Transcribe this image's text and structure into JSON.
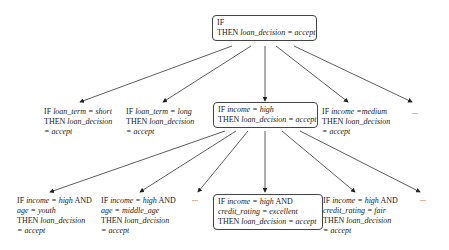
{
  "diagram": {
    "type": "rule-refinement-tree",
    "root": {
      "lines": [
        "IF",
        "THEN loan_decision = accept"
      ],
      "if": "IF",
      "then_kw": "THEN",
      "then_expr": "loan_decision = accept"
    },
    "level1": [
      {
        "if_kw": "IF",
        "if_expr": "loan_term = short",
        "then_kw": "THEN",
        "then_expr": "loan_decision",
        "cont": "= accept"
      },
      {
        "if_kw": "IF",
        "if_expr": "loan_term = long",
        "then_kw": "THEN",
        "then_expr": "loan_decision",
        "cont": "= accept"
      },
      {
        "if_kw": "IF",
        "if_expr": "income = high",
        "then_kw": "THEN",
        "then_expr": "loan_decision = accept",
        "boxed": true
      },
      {
        "if_kw": "IF",
        "if_expr": "income =medium",
        "then_kw": "THEN",
        "then_expr": "loan_decision",
        "cont": "= accept"
      },
      {
        "text": "..."
      }
    ],
    "level2": [
      {
        "if_kw": "IF",
        "if_expr": "income = high",
        "and": "AND",
        "cond2": "age = youth",
        "then_kw": "THEN",
        "then_expr": "loan_decision",
        "cont": "= accept"
      },
      {
        "if_kw": "IF",
        "if_expr": "income = high",
        "and": "AND",
        "cond2": "age = middle_age",
        "then_kw": "THEN",
        "then_expr": "loan_decision",
        "cont": "= accept"
      },
      {
        "text": "..."
      },
      {
        "if_kw": "IF",
        "if_expr": "income = high",
        "and": "AND",
        "cond2": "credit_rating = excellent",
        "then_kw": "THEN",
        "then_expr": "loan_decision = accept",
        "boxed": true
      },
      {
        "if_kw": "IF",
        "if_expr": "income = high",
        "and": "AND",
        "cond2": "credit_rating = fair",
        "then_kw": "THEN",
        "then_expr": "loan_decision",
        "cont": "= accept"
      },
      {
        "text": "..."
      }
    ]
  }
}
